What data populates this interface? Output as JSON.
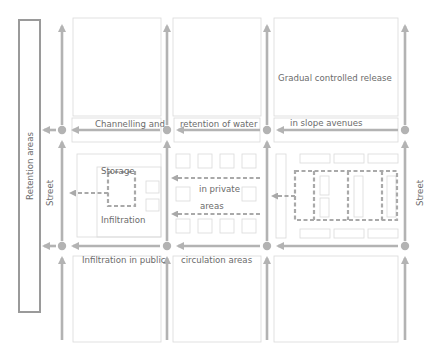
{
  "diagram": {
    "colors": {
      "arrow": "#b3b3b3",
      "text": "#6b6b6b",
      "block_outline": "#d9d9d9",
      "dashed_flow": "#a9a9a9",
      "retention_box": "#9a9a9a"
    },
    "labels": {
      "retention_areas": "Retention areas",
      "street_left": "Street",
      "street_right": "Street",
      "gradual_release": "Gradual controlled release",
      "channelling_1": "Channelling and",
      "channelling_2": "retention of water",
      "channelling_3": "in slope avenues",
      "storage": "Storage",
      "infiltration": "Infiltration",
      "private_1": "in private",
      "private_2": "areas",
      "public_1": "Infiltration in public",
      "public_2": "circulation areas"
    },
    "nodes": [
      {
        "id": "n1",
        "x": 62,
        "y": 130
      },
      {
        "id": "n2",
        "x": 167,
        "y": 130
      },
      {
        "id": "n3",
        "x": 267,
        "y": 130
      },
      {
        "id": "n4",
        "x": 405,
        "y": 130
      },
      {
        "id": "n5",
        "x": 62,
        "y": 246
      },
      {
        "id": "n6",
        "x": 167,
        "y": 246
      },
      {
        "id": "n7",
        "x": 267,
        "y": 246
      },
      {
        "id": "n8",
        "x": 405,
        "y": 246
      }
    ]
  }
}
